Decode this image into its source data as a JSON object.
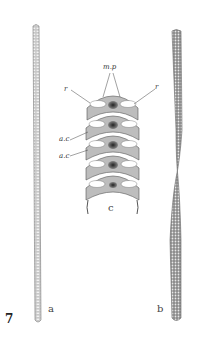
{
  "figure": {
    "number": "7",
    "panels": [
      {
        "id": "a",
        "label": "a",
        "description": "long straight striated filament"
      },
      {
        "id": "b",
        "label": "b",
        "description": "twisted filament with cross-hatched pattern"
      },
      {
        "id": "c",
        "label": "c",
        "description": "enlarged segment with labeled parts"
      }
    ],
    "annotations": {
      "mp": "m.p",
      "r_left": "r",
      "r_right": "r",
      "ac_1": "a.c",
      "ac_2": "a.c"
    },
    "colors": {
      "background": "#ffffff",
      "ink": "#333333",
      "shade": "#9a9a9a",
      "dark": "#444444"
    }
  }
}
